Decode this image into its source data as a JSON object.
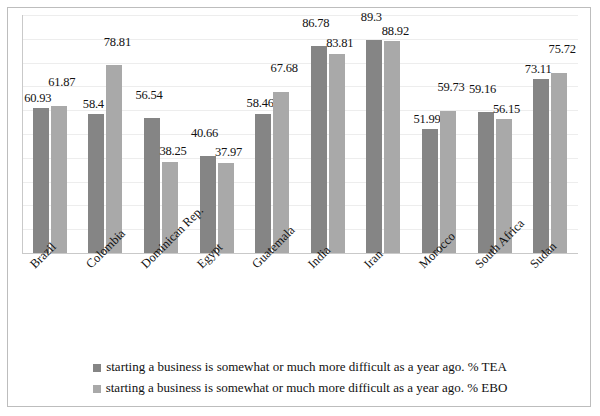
{
  "chart_data": {
    "type": "bar",
    "title": "",
    "subtitle": "",
    "xlabel": "",
    "ylabel": "",
    "ylim": [
      0,
      100
    ],
    "grid": true,
    "legend_position": "bottom",
    "categories": [
      "Brazil",
      "Colombia",
      "Dominican Rep.",
      "Egypt",
      "Guatemala",
      "India",
      "Iran",
      "Morocco",
      "South Africa",
      "Sudan"
    ],
    "series": [
      {
        "name": "starting a business is somewhat or much more difficult as a year ago. % TEA",
        "color": "#858585",
        "values": [
          60.93,
          58.4,
          56.54,
          40.66,
          58.46,
          86.78,
          89.3,
          51.99,
          59.16,
          73.11
        ],
        "labels": [
          "60.93",
          "58.4",
          "56.54",
          "40.66",
          "58.46",
          "86.78",
          "89.3",
          "51.99",
          "59.16",
          "73.11"
        ]
      },
      {
        "name": "starting a business is somewhat or much more difficult as a year ago. % EBO",
        "color": "#a9a9a9",
        "values": [
          61.87,
          78.81,
          38.25,
          37.97,
          67.68,
          83.81,
          88.92,
          59.73,
          56.15,
          75.72
        ],
        "labels": [
          "61.87",
          "78.81",
          "38.25",
          "37.97",
          "67.68",
          "83.81",
          "88.92",
          "59.73",
          "56.15",
          "75.72"
        ]
      }
    ],
    "gridline_count": 11,
    "axis_tick_labels_visible": false
  },
  "legend": {
    "items": [
      {
        "label": "starting a business is somewhat or much more difficult as a year ago. % TEA",
        "swatch": "#858585"
      },
      {
        "label": "starting a business is somewhat or much more difficult as a year ago. % EBO",
        "swatch": "#a9a9a9"
      }
    ]
  },
  "colors": {
    "series_tea": "#858585",
    "series_ebo": "#a9a9a9",
    "gridline": "#ededed",
    "axis": "#c9c9c9",
    "frame": "#bdbdbd",
    "background": "#ffffff",
    "text": "#111111"
  }
}
